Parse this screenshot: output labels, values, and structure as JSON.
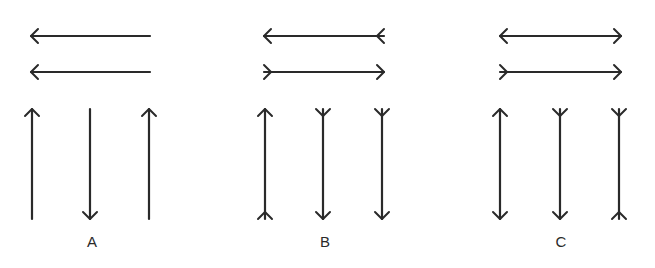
{
  "figure": {
    "stroke_color": "#2a2a2a",
    "background": "#ffffff"
  },
  "panels": [
    {
      "label": "A",
      "label_x": 92,
      "horizontals": [
        {
          "x1": 31,
          "x2": 150,
          "y": 36,
          "left": "head",
          "right": "none"
        },
        {
          "x1": 31,
          "x2": 150,
          "y": 72,
          "left": "head",
          "right": "none"
        }
      ],
      "verticals": [
        {
          "x": 32,
          "y1": 109,
          "y2": 219,
          "top": "head",
          "bottom": "none"
        },
        {
          "x": 90,
          "y1": 109,
          "y2": 219,
          "top": "none",
          "bottom": "head"
        },
        {
          "x": 149,
          "y1": 109,
          "y2": 219,
          "top": "head",
          "bottom": "none"
        }
      ]
    },
    {
      "label": "B",
      "label_x": 325,
      "horizontals": [
        {
          "x1": 264,
          "x2": 384,
          "y": 36,
          "left": "head",
          "right": "fork"
        },
        {
          "x1": 264,
          "x2": 384,
          "y": 72,
          "left": "fork",
          "right": "head"
        }
      ],
      "verticals": [
        {
          "x": 265,
          "y1": 109,
          "y2": 219,
          "top": "head",
          "bottom": "fork"
        },
        {
          "x": 323,
          "y1": 109,
          "y2": 219,
          "top": "fork",
          "bottom": "head"
        },
        {
          "x": 382,
          "y1": 109,
          "y2": 219,
          "top": "fork",
          "bottom": "head"
        }
      ]
    },
    {
      "label": "C",
      "label_x": 561,
      "horizontals": [
        {
          "x1": 500,
          "x2": 621,
          "y": 36,
          "left": "head",
          "right": "head"
        },
        {
          "x1": 500,
          "x2": 621,
          "y": 72,
          "left": "fork",
          "right": "head"
        }
      ],
      "verticals": [
        {
          "x": 500,
          "y1": 109,
          "y2": 219,
          "top": "head",
          "bottom": "head"
        },
        {
          "x": 560,
          "y1": 109,
          "y2": 219,
          "top": "fork",
          "bottom": "head"
        },
        {
          "x": 619,
          "y1": 109,
          "y2": 219,
          "top": "fork",
          "bottom": "fork"
        }
      ]
    }
  ]
}
